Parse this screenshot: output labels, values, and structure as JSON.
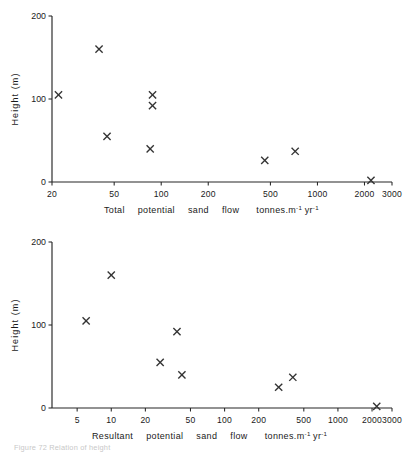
{
  "figure": {
    "caption_partial": "Figure 72 Relation of height",
    "y_axis_label": "Height (m)",
    "unit_suffix": "tonnes.m",
    "unit_exp1": "-1",
    "unit_mid": "yr",
    "unit_exp2": "-1"
  },
  "chart_data": [
    {
      "type": "scatter",
      "title": "",
      "xlabel": "Total  potential  sand  flow   tonnes.m-1 yr-1",
      "xlabel_words": [
        "Total",
        "potential",
        "sand",
        "flow",
        "tonnes.m",
        "yr"
      ],
      "ylabel": "Height (m)",
      "xscale": "log",
      "xlim": [
        20,
        3000
      ],
      "ylim": [
        0,
        200
      ],
      "xticks": [
        20,
        50,
        100,
        200,
        500,
        1000,
        2000,
        3000
      ],
      "xticklabels": [
        "20",
        "50",
        "100",
        "200",
        "500",
        "1000",
        "2000",
        "3000"
      ],
      "yticks": [
        0,
        100,
        200
      ],
      "yticklabels": [
        "0",
        "100",
        "200"
      ],
      "grid": false,
      "legend": "none",
      "marker": "x",
      "x": [
        22,
        40,
        45,
        85,
        88,
        88,
        460,
        720,
        2200
      ],
      "y": [
        105,
        160,
        55,
        40,
        105,
        92,
        26,
        37,
        2
      ]
    },
    {
      "type": "scatter",
      "title": "",
      "xlabel": "Resultant  potential  sand  flow   tonnes.m-1 yr-1",
      "xlabel_words": [
        "Resultant",
        "potential",
        "sand",
        "flow",
        "tonnes.m",
        "yr"
      ],
      "ylabel": "Height (m)",
      "xscale": "log",
      "xlim": [
        3,
        3000
      ],
      "ylim": [
        0,
        200
      ],
      "xticks": [
        5,
        10,
        20,
        50,
        100,
        200,
        500,
        1000,
        2000,
        3000
      ],
      "xticklabels": [
        "5",
        "10",
        "20",
        "50",
        "100",
        "200",
        "500",
        "1000",
        "2000",
        "3000"
      ],
      "yticks": [
        0,
        100,
        200
      ],
      "yticklabels": [
        "0",
        "100",
        "200"
      ],
      "grid": false,
      "legend": "none",
      "marker": "x",
      "x": [
        6,
        10,
        27,
        38,
        42,
        300,
        400,
        2200
      ],
      "y": [
        105,
        160,
        55,
        92,
        40,
        25,
        37,
        2
      ]
    }
  ]
}
